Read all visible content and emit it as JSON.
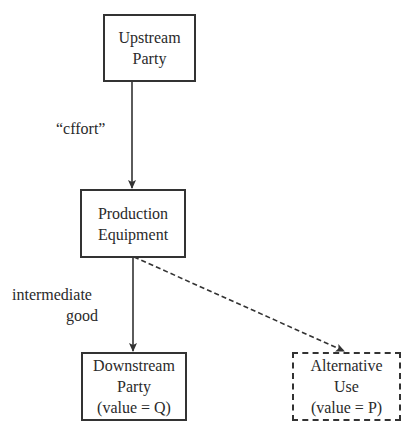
{
  "diagram": {
    "nodes": {
      "upstream": {
        "lines": [
          "Upstream",
          "Party"
        ]
      },
      "production": {
        "lines": [
          "Production",
          "Equipment"
        ]
      },
      "downstream": {
        "lines": [
          "Downstream",
          "Party",
          "(value = Q)"
        ]
      },
      "alternative": {
        "lines": [
          "Alternative",
          "Use",
          "(value = P)"
        ]
      }
    },
    "edges": {
      "effort": {
        "label": "“cffort”",
        "from": "upstream",
        "to": "production",
        "style": "solid"
      },
      "intermediate": {
        "label_lines": [
          "intermediate",
          "good"
        ],
        "from": "production",
        "to": "downstream",
        "style": "solid"
      },
      "alternative": {
        "from": "production",
        "to": "alternative",
        "style": "dashed"
      }
    },
    "colors": {
      "stroke": "#333333",
      "text": "#2a2a2a",
      "background": "#ffffff"
    }
  }
}
